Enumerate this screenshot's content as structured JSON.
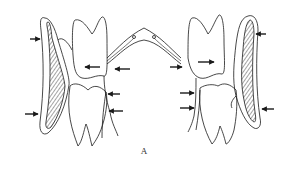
{
  "figure": {
    "caption": "A",
    "colors": {
      "line": "#1a1a1a",
      "background": "#ffffff"
    },
    "arrows": {
      "left_side": [
        {
          "position": "upper-outer",
          "direction": "right"
        },
        {
          "position": "upper-tooth",
          "direction": "left"
        },
        {
          "position": "upper-inner",
          "direction": "left"
        },
        {
          "position": "lower-inner-1",
          "direction": "left"
        },
        {
          "position": "lower-inner-2",
          "direction": "left"
        },
        {
          "position": "lower-outer",
          "direction": "right"
        }
      ],
      "right_side": [
        {
          "position": "upper-outer",
          "direction": "left"
        },
        {
          "position": "upper-tooth",
          "direction": "right"
        },
        {
          "position": "upper-inner",
          "direction": "right"
        },
        {
          "position": "lower-inner-1",
          "direction": "right"
        },
        {
          "position": "lower-inner-2",
          "direction": "right"
        },
        {
          "position": "lower-outer",
          "direction": "left"
        }
      ]
    }
  }
}
